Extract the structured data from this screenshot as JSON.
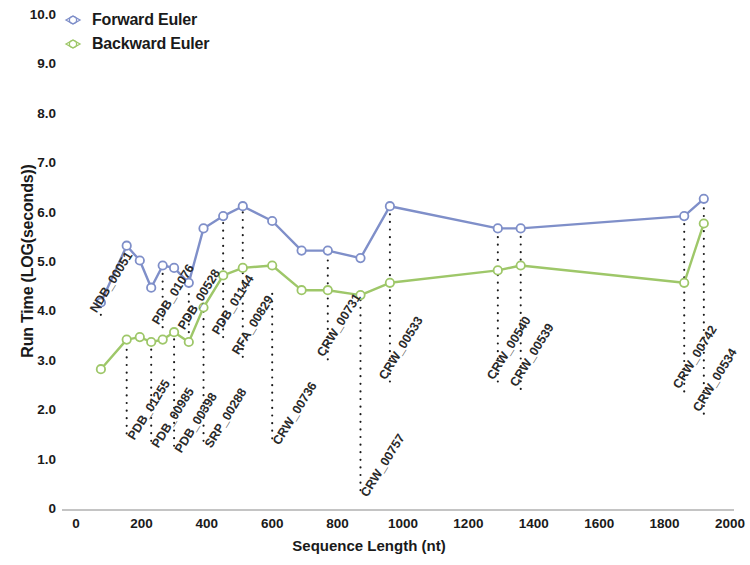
{
  "chart_data": {
    "type": "line",
    "title": "",
    "xlabel": "Sequence Length (nt)",
    "ylabel": "Run Time (LOG(seconds))",
    "xlim": [
      0,
      2000
    ],
    "ylim": [
      0,
      10
    ],
    "xticks": [
      0,
      200,
      400,
      600,
      800,
      1000,
      1200,
      1400,
      1600,
      1800,
      2000
    ],
    "yticks": [
      "0",
      "1.0",
      "2.0",
      "3.0",
      "4.0",
      "5.0",
      "6.0",
      "7.0",
      "8.0",
      "9.0",
      "10.0"
    ],
    "grid": false,
    "legend_position": "top-left",
    "series": [
      {
        "name": "Forward Euler",
        "color": "#7f8fc9",
        "marker": "open-circle",
        "x": [
          76,
          155,
          195,
          230,
          265,
          300,
          345,
          390,
          450,
          510,
          600,
          690,
          770,
          870,
          960,
          1290,
          1360,
          1860,
          1920
        ],
        "values": [
          4.2,
          5.35,
          5.05,
          4.5,
          4.95,
          4.9,
          4.6,
          5.7,
          5.95,
          6.15,
          5.85,
          5.25,
          5.25,
          5.1,
          6.15,
          5.7,
          5.7,
          5.95,
          6.3
        ]
      },
      {
        "name": "Backward Euler",
        "color": "#9ec769",
        "marker": "open-circle",
        "x": [
          76,
          155,
          195,
          230,
          265,
          300,
          345,
          390,
          450,
          510,
          600,
          690,
          770,
          870,
          960,
          1290,
          1360,
          1860,
          1920
        ],
        "values": [
          2.85,
          3.45,
          3.5,
          3.4,
          3.45,
          3.6,
          3.4,
          4.1,
          4.75,
          4.9,
          4.95,
          4.45,
          4.45,
          4.35,
          4.6,
          4.85,
          4.95,
          4.6,
          5.8
        ]
      }
    ],
    "callouts_top": [
      {
        "label": "NDB_00051",
        "x": 76,
        "y_top": 3.95,
        "y_bottom": 4.2
      },
      {
        "label": "PDB_01076",
        "x": 265,
        "y_top": 3.7,
        "y_bottom": 4.95
      },
      {
        "label": "PDB_00528",
        "x": 345,
        "y_top": 3.6,
        "y_bottom": 4.6
      },
      {
        "label": "PDB_01144",
        "x": 450,
        "y_top": 3.5,
        "y_bottom": 5.95
      },
      {
        "label": "RFA_00829",
        "x": 510,
        "y_top": 3.1,
        "y_bottom": 6.15
      },
      {
        "label": "CRW_00731",
        "x": 770,
        "y_top": 3.05,
        "y_bottom": 5.25
      },
      {
        "label": "CRW_00533",
        "x": 960,
        "y_top": 2.6,
        "y_bottom": 6.15
      },
      {
        "label": "CRW_00540",
        "x": 1290,
        "y_top": 2.6,
        "y_bottom": 5.7
      },
      {
        "label": "CRW_00539",
        "x": 1360,
        "y_top": 2.45,
        "y_bottom": 5.7
      },
      {
        "label": "CRW_00742",
        "x": 1860,
        "y_top": 2.4,
        "y_bottom": 5.95
      },
      {
        "label": "CRW_00534",
        "x": 1920,
        "y_top": 1.95,
        "y_bottom": 6.3
      }
    ],
    "callouts_bottom": [
      {
        "label": "PDB_01255",
        "x": 155,
        "y_top": 3.45,
        "y_bottom": 8.45
      },
      {
        "label": "PDB_00985",
        "x": 230,
        "y_top": 3.4,
        "y_bottom": 8.6
      },
      {
        "label": "PDB_00398",
        "x": 300,
        "y_top": 3.6,
        "y_bottom": 8.7
      },
      {
        "label": "SRP_00288",
        "x": 390,
        "y_top": 4.1,
        "y_bottom": 8.6
      },
      {
        "label": "CRW_00736",
        "x": 600,
        "y_top": 4.45,
        "y_bottom": 8.55
      },
      {
        "label": "CRW_00757",
        "x": 870,
        "y_top": 4.35,
        "y_bottom": 9.6
      }
    ]
  },
  "axes": {
    "y_title": "Run Time (LOG(seconds))",
    "x_title": "Sequence Length (nt)",
    "y_tick_labels": [
      "10.0",
      "9.0",
      "8.0",
      "7.0",
      "6.0",
      "5.0",
      "4.0",
      "3.0",
      "2.0",
      "1.0",
      "0"
    ],
    "x_tick_labels": [
      "0",
      "200",
      "400",
      "600",
      "800",
      "1000",
      "1200",
      "1400",
      "1600",
      "1800",
      "2000"
    ]
  },
  "legend": {
    "items": [
      {
        "label": "Forward Euler",
        "color": "#7f8fc9"
      },
      {
        "label": "Backward Euler",
        "color": "#9ec769"
      }
    ]
  }
}
